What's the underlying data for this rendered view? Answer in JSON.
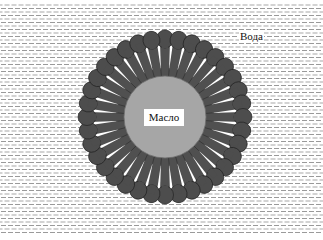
{
  "figure": {
    "type": "micelle-diagram",
    "labels": {
      "outer_medium": "Вода",
      "core": "Масло"
    },
    "surfactant_count": 36,
    "colors": {
      "background": "#ffffff",
      "water_dash": "#9a9a9a",
      "core_fill": "#a6a6a6",
      "core_stroke": "#6f6f6f",
      "head_fill": "#4d4d4d",
      "head_stroke": "#222222",
      "tail_fill": "#505050",
      "gap": "#ffffff"
    },
    "geometry": {
      "center": [
        165,
        117
      ],
      "core_radius": 41,
      "head_center_radius": 78,
      "head_radius": 8.5
    }
  }
}
